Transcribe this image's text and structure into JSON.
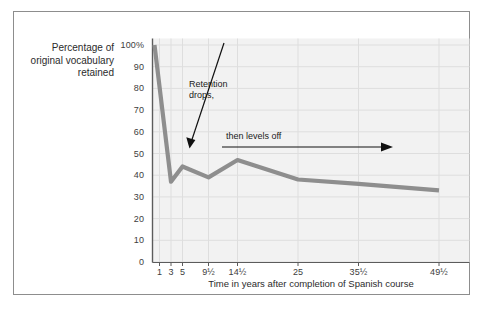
{
  "chart_data": {
    "type": "line",
    "title": "",
    "xlabel": "Time in years after completion of Spanish course",
    "ylabel": "Percentage of original vocabulary retained",
    "ylabel_lines": [
      "Percentage of",
      "original vocabulary",
      "retained"
    ],
    "x_tick_labels": [
      "1",
      "3",
      "5",
      "9½",
      "14½",
      "25",
      "35½",
      "49½"
    ],
    "x_tick_values": [
      1,
      3,
      5,
      9.5,
      14.5,
      25,
      35.5,
      49.5
    ],
    "y_tick_labels": [
      "100%",
      "90",
      "80",
      "70",
      "60",
      "50",
      "40",
      "30",
      "20",
      "10",
      "0"
    ],
    "y_tick_values": [
      100,
      90,
      80,
      70,
      60,
      50,
      40,
      30,
      20,
      10,
      0
    ],
    "ylim": [
      0,
      103
    ],
    "xlim": [
      0,
      55
    ],
    "grid": true,
    "legend": "none",
    "series": [
      {
        "name": "Percentage of original vocabulary retained",
        "color": "#8e8e8e",
        "x": [
          1,
          3,
          5,
          9.5,
          14.5,
          25,
          35.5,
          49.5
        ],
        "values": [
          100,
          37,
          44,
          39,
          47,
          38,
          36,
          33
        ]
      }
    ],
    "annotations": [
      {
        "id": "retention-drops",
        "text": "Retention\ndrops,",
        "arrow": "diagonal-down-left",
        "arrow_from": [
          224,
          43
        ],
        "arrow_to": [
          190,
          146
        ]
      },
      {
        "id": "then-levels-off",
        "text": "then levels off",
        "arrow": "horizontal-right",
        "arrow_from": [
          222,
          147
        ],
        "arrow_to": [
          390,
          147
        ]
      }
    ]
  },
  "style": {
    "plot_background": "#f2f2f2",
    "grid_color": "#dddddd",
    "line_color": "#8e8e8e",
    "axis_text_color": "#3d3d3d",
    "frame_color": "#8d8d8d",
    "annotation_color": "#1a1a1a"
  }
}
